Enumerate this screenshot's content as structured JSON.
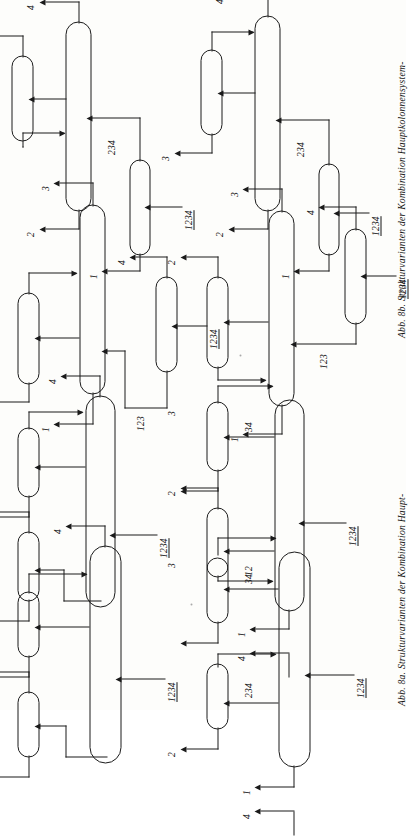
{
  "page": {
    "kind": "scanned-book-figure-page",
    "orientation": "figures rotated 90 degrees (landscape figures on portrait page)"
  },
  "captions": [
    {
      "id": "abb-8b",
      "text": "Abb. 8b. Strukturvarianten der Kombination Hauptkolonnensystem-",
      "number": "Abb. 8b."
    },
    {
      "id": "abb-8a",
      "text": "Abb. 8a. Strukturvarianten der Kombination Haupt-",
      "number": "Abb. 8a."
    }
  ],
  "figures": [
    {
      "id": "fig-top-left",
      "position": "top-left",
      "feed_label": "1234",
      "intermediate_labels": [
        "234"
      ],
      "product_labels": [
        "1",
        "2",
        "3",
        "4"
      ],
      "columns": 3
    },
    {
      "id": "fig-top-right",
      "position": "top-right",
      "feed_label": "1234",
      "intermediate_labels": [
        "234"
      ],
      "product_labels": [
        "1",
        "2",
        "3",
        "4"
      ],
      "columns": 3
    },
    {
      "id": "fig-mid-left",
      "position": "middle-left",
      "feed_label": "1234",
      "intermediate_labels": [
        "123"
      ],
      "product_labels": [
        "1",
        "2",
        "3",
        "4"
      ],
      "columns": 3
    },
    {
      "id": "fig-mid-right",
      "position": "middle-right",
      "feed_label": "1234",
      "intermediate_labels": [
        "123"
      ],
      "product_labels": [
        "1",
        "2",
        "3",
        "4"
      ],
      "columns": 3
    },
    {
      "id": "fig-bot-left",
      "position": "bottom-left",
      "feed_label": "1234",
      "intermediate_labels": [
        "12",
        "34"
      ],
      "product_labels": [
        "1",
        "2",
        "3",
        "4"
      ],
      "columns": 3
    },
    {
      "id": "fig-bot-right",
      "position": "bottom-right",
      "feed_label": "1234",
      "intermediate_labels": [
        "234",
        "34"
      ],
      "product_labels": [
        "1",
        "2",
        "3",
        "4"
      ],
      "columns": 3
    },
    {
      "id": "fig-bot-far-left",
      "position": "bottom-far-left",
      "feed_label": "1234",
      "intermediate_labels": [],
      "product_labels": [
        "1",
        "2",
        "3",
        "4"
      ],
      "columns": 3
    },
    {
      "id": "fig-bot-far-right",
      "position": "bottom-far-right",
      "feed_label": "1234",
      "intermediate_labels": [
        "12",
        "34"
      ],
      "product_labels": [
        "1",
        "2",
        "3",
        "4"
      ],
      "columns": 3
    }
  ],
  "labels": {
    "n1": "1",
    "n2": "2",
    "n3": "3",
    "n4": "4",
    "n12": "12",
    "n34": "34",
    "n123": "123",
    "n234": "234",
    "n1234": "1234"
  }
}
